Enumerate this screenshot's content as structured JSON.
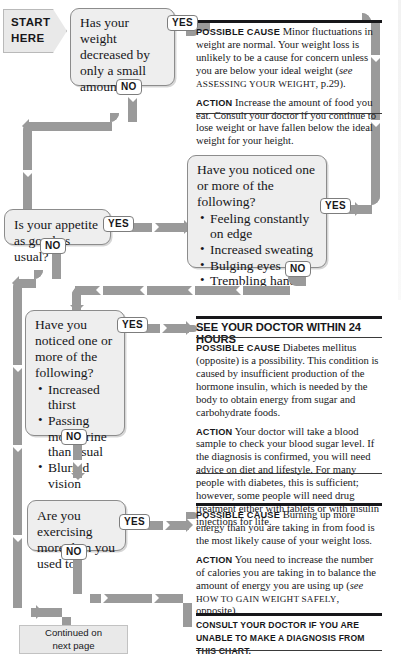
{
  "start": {
    "line1": "START",
    "line2": "HERE"
  },
  "labels": {
    "yes": "YES",
    "no": "NO"
  },
  "nodes": {
    "q1": {
      "text": "Has your weight decreased by only a small amount?"
    },
    "q2": {
      "text": "Is your appetite as good as usual?"
    },
    "q3": {
      "text": "Have you noticed one or more of the following?",
      "items": [
        "Feeling constantly on edge",
        "Increased sweating",
        "Bulging eyes",
        "Trembling hands"
      ]
    },
    "q4": {
      "text": "Have you noticed one or more of the following?",
      "items": [
        "Increased thirst",
        "Passing more urine than usual",
        "Blurred vision"
      ]
    },
    "q5": {
      "text": "Are you exercising more than you used to?"
    }
  },
  "advice": {
    "a1": {
      "cause_label": "Possible cause",
      "cause_text_1": "Minor fluctuations in weight are normal. Your weight loss is unlikely to be a cause for concern unless you are below your ideal weight (",
      "cause_italic": "see",
      "cause_smallcaps": " Assessing your weight",
      "cause_text_2": ", p.29).",
      "action_label": "Action",
      "action_text": "Increase the amount of food you eat. Consult your doctor if you continue to lose weight or have fallen below the ideal weight for your height."
    },
    "a2": {
      "heading": "SEE YOUR DOCTOR WITHIN 24 HOURS",
      "cause_label": "Possible cause",
      "cause_text": "Diabetes mellitus (opposite) is a possibility. This condition is caused by insufficient production of the hormone insulin, which is needed by the body to obtain energy from sugar and carbohydrate foods.",
      "action_label": "Action",
      "action_text": "Your doctor will take a blood sample to check your blood sugar level. If the diagnosis is confirmed, you will need advice on diet and lifestyle. For many people with diabetes, this is sufficient; however, some people will need drug treatment either with tablets or with insulin injections for life."
    },
    "a3": {
      "cause_label": "Possible cause",
      "cause_text": "Burning up more energy than you are taking in from food is the most likely cause of your weight loss.",
      "action_label": "Action",
      "action_text_1": "You need to increase the number of calories you are taking in to balance the amount of energy you are using up (",
      "action_italic": "see",
      "action_smallcaps": " How to gain weight safely",
      "action_text_2": ", opposite)."
    }
  },
  "footer": {
    "consult": "Consult your doctor if you are unable to make a diagnosis from this chart.",
    "continued_line1": "Continued on",
    "continued_line2": "next page"
  },
  "colors": {
    "connector": "#9a9a9a",
    "box_fill": "#eeeeee",
    "box_border": "#8c8c8c",
    "text": "#17171a"
  }
}
